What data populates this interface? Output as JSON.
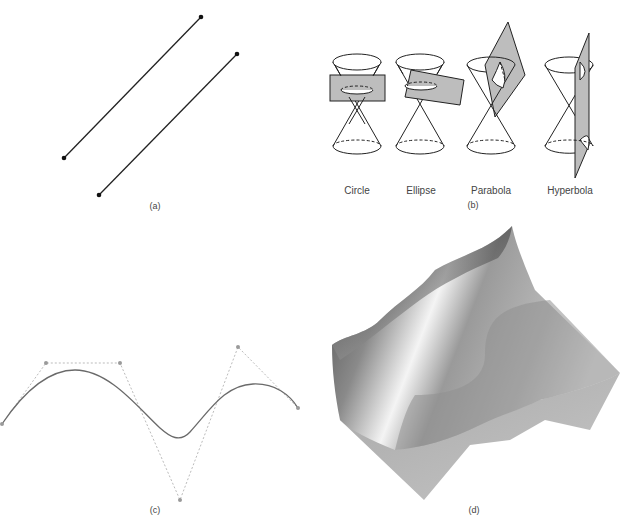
{
  "panels": {
    "a": {
      "label": "(a)",
      "description": "Two parallel line segments with endpoints",
      "segments": [
        {
          "x1": 64,
          "y1": 158,
          "x2": 201,
          "y2": 17
        },
        {
          "x1": 99,
          "y1": 195,
          "x2": 237,
          "y2": 54
        }
      ]
    },
    "b": {
      "label": "(b)",
      "description": "Conic sections from plane intersecting double cone",
      "conics": [
        {
          "name": "Circle"
        },
        {
          "name": "Ellipse"
        },
        {
          "name": "Parabola"
        },
        {
          "name": "Hyperbola"
        }
      ]
    },
    "c": {
      "label": "(c)",
      "description": "Spline curve with control polygon",
      "control_points": [
        {
          "x": 2,
          "y": 424
        },
        {
          "x": 46,
          "y": 363
        },
        {
          "x": 120,
          "y": 363
        },
        {
          "x": 180,
          "y": 500
        },
        {
          "x": 238,
          "y": 347
        },
        {
          "x": 298,
          "y": 408
        }
      ]
    },
    "d": {
      "label": "(d)",
      "description": "Shaded 3D surface intersecting a plane"
    }
  },
  "colors": {
    "line": "#222222",
    "plane_fill": "#bdbdbd",
    "control_polygon": "#aaaaaa",
    "curve": "#6a6a6a",
    "surface_dark": "#5a5a5a",
    "surface_light": "#f2f2f2"
  }
}
